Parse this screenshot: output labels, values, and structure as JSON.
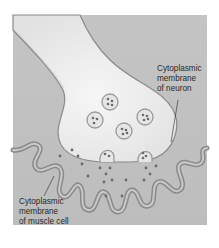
{
  "diagram": {
    "type": "neuromuscular-junction",
    "colors": {
      "background": "#bfbfbf",
      "neuron_fill": "#ededed",
      "membrane_stroke": "#8a8a8a",
      "vesicle_fill": "#e6e6e6",
      "dot_fill": "#6a6a6a",
      "label_text": "#2a2a2a"
    },
    "labels": {
      "neuron_membrane": {
        "lines": [
          "Cytoplasmic",
          "membrane",
          "of neuron"
        ]
      },
      "muscle_membrane": {
        "lines": [
          "Cytoplasmic",
          "membrane",
          "of muscle cell"
        ]
      }
    }
  }
}
